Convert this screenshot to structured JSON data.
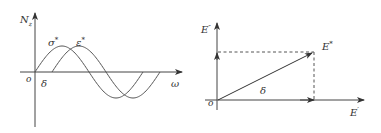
{
  "left_diagram": {
    "y_axis_label": "N",
    "y_axis_subscript": "z",
    "x_axis_label": "ω",
    "origin_label": "o",
    "phase_label": "δ",
    "curves": [
      {
        "name": "stress",
        "label": "σ",
        "superscript": "*",
        "phase_offset": 0
      },
      {
        "name": "strain",
        "label": "ε",
        "superscript": "*",
        "phase_offset": "δ"
      }
    ]
  },
  "right_diagram": {
    "y_axis_label": "E",
    "y_axis_superscript": "″",
    "x_axis_label": "E",
    "x_axis_superscript": "′",
    "vector_label": "E",
    "vector_superscript": "*",
    "origin_label": "o",
    "angle_label": "δ"
  },
  "colors": {
    "line": "#444444",
    "text": "#333333",
    "background": "#ffffff"
  }
}
